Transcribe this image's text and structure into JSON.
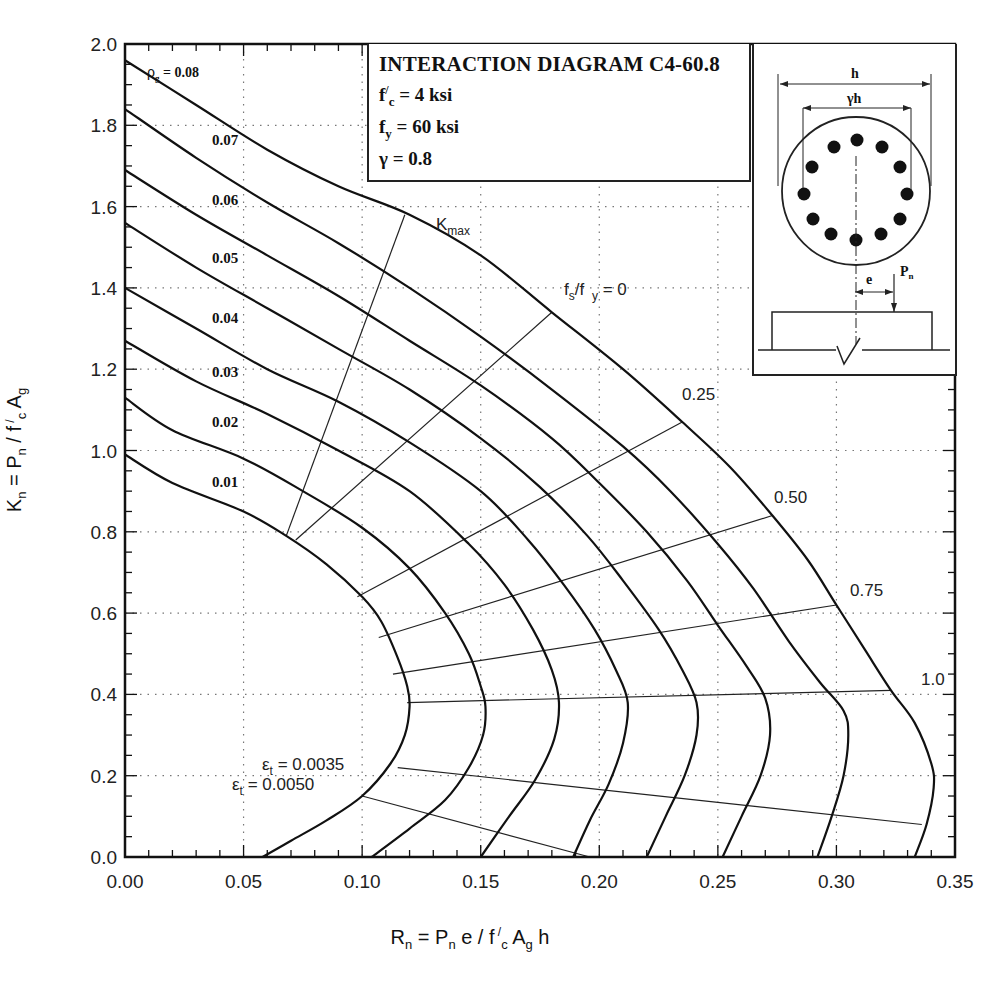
{
  "chart_data": {
    "type": "line",
    "title": "INTERACTION DIAGRAM C4-60.8",
    "parameters": [
      {
        "label": "f'c = 4 ksi"
      },
      {
        "label": "fy = 60 ksi"
      },
      {
        "label": "γ = 0.8"
      }
    ],
    "xlabel": "Rn = Pn e / f'c Ag h",
    "ylabel": "Kn = Pn / f'c Ag",
    "xlim": [
      0,
      0.35
    ],
    "ylim": [
      0,
      2.0
    ],
    "grid": "dotted",
    "x_ticks": [
      "0.00",
      "0.05",
      "0.10",
      "0.15",
      "0.20",
      "0.25",
      "0.30",
      "0.35"
    ],
    "y_ticks": [
      "0.0",
      "0.2",
      "0.4",
      "0.6",
      "0.8",
      "1.0",
      "1.2",
      "1.4",
      "1.6",
      "1.8",
      "2.0"
    ],
    "series": [
      {
        "name": "ρg = 0.01",
        "label": "0.01",
        "points": [
          [
            0,
            0.99
          ],
          [
            0.02,
            0.92
          ],
          [
            0.05,
            0.85
          ],
          [
            0.068,
            0.79
          ],
          [
            0.085,
            0.72
          ],
          [
            0.1,
            0.64
          ],
          [
            0.108,
            0.58
          ],
          [
            0.115,
            0.49
          ],
          [
            0.119,
            0.42
          ],
          [
            0.12,
            0.37
          ],
          [
            0.118,
            0.3
          ],
          [
            0.112,
            0.23
          ],
          [
            0.1,
            0.15
          ],
          [
            0.085,
            0.09
          ],
          [
            0.07,
            0.04
          ],
          [
            0.058,
            0
          ]
        ]
      },
      {
        "name": "ρg = 0.02",
        "label": "0.02",
        "points": [
          [
            0,
            1.13
          ],
          [
            0.02,
            1.05
          ],
          [
            0.05,
            0.98
          ],
          [
            0.075,
            0.9
          ],
          [
            0.1,
            0.81
          ],
          [
            0.12,
            0.71
          ],
          [
            0.135,
            0.6
          ],
          [
            0.145,
            0.5
          ],
          [
            0.15,
            0.42
          ],
          [
            0.152,
            0.37
          ],
          [
            0.151,
            0.3
          ],
          [
            0.145,
            0.22
          ],
          [
            0.135,
            0.14
          ],
          [
            0.12,
            0.07
          ],
          [
            0.104,
            0
          ]
        ]
      },
      {
        "name": "ρg = 0.03",
        "label": "0.03",
        "points": [
          [
            0,
            1.27
          ],
          [
            0.03,
            1.17
          ],
          [
            0.06,
            1.09
          ],
          [
            0.09,
            1.0
          ],
          [
            0.12,
            0.9
          ],
          [
            0.145,
            0.77
          ],
          [
            0.16,
            0.67
          ],
          [
            0.172,
            0.56
          ],
          [
            0.18,
            0.46
          ],
          [
            0.183,
            0.38
          ],
          [
            0.181,
            0.29
          ],
          [
            0.173,
            0.19
          ],
          [
            0.162,
            0.1
          ],
          [
            0.15,
            0
          ]
        ]
      },
      {
        "name": "ρg = 0.04",
        "label": "0.04",
        "points": [
          [
            0,
            1.4
          ],
          [
            0.03,
            1.3
          ],
          [
            0.06,
            1.2
          ],
          [
            0.09,
            1.12
          ],
          [
            0.12,
            1.02
          ],
          [
            0.15,
            0.9
          ],
          [
            0.17,
            0.78
          ],
          [
            0.185,
            0.67
          ],
          [
            0.198,
            0.56
          ],
          [
            0.207,
            0.46
          ],
          [
            0.212,
            0.38
          ],
          [
            0.21,
            0.28
          ],
          [
            0.204,
            0.18
          ],
          [
            0.196,
            0.09
          ],
          [
            0.189,
            0
          ]
        ]
      },
      {
        "name": "ρg = 0.05",
        "label": "0.05",
        "points": [
          [
            0,
            1.56
          ],
          [
            0.03,
            1.45
          ],
          [
            0.06,
            1.35
          ],
          [
            0.09,
            1.25
          ],
          [
            0.12,
            1.15
          ],
          [
            0.15,
            1.03
          ],
          [
            0.175,
            0.91
          ],
          [
            0.195,
            0.79
          ],
          [
            0.21,
            0.68
          ],
          [
            0.225,
            0.56
          ],
          [
            0.235,
            0.46
          ],
          [
            0.241,
            0.38
          ],
          [
            0.241,
            0.3
          ],
          [
            0.236,
            0.2
          ],
          [
            0.228,
            0.1
          ],
          [
            0.22,
            0
          ]
        ]
      },
      {
        "name": "ρg = 0.06",
        "label": "0.06",
        "points": [
          [
            0,
            1.69
          ],
          [
            0.03,
            1.58
          ],
          [
            0.06,
            1.48
          ],
          [
            0.09,
            1.38
          ],
          [
            0.12,
            1.27
          ],
          [
            0.15,
            1.16
          ],
          [
            0.18,
            1.03
          ],
          [
            0.2,
            0.92
          ],
          [
            0.22,
            0.8
          ],
          [
            0.237,
            0.68
          ],
          [
            0.25,
            0.57
          ],
          [
            0.262,
            0.47
          ],
          [
            0.27,
            0.39
          ],
          [
            0.272,
            0.3
          ],
          [
            0.268,
            0.2
          ],
          [
            0.26,
            0.1
          ],
          [
            0.252,
            0
          ]
        ]
      },
      {
        "name": "ρg = 0.07",
        "label": "0.07",
        "points": [
          [
            0,
            1.84
          ],
          [
            0.03,
            1.72
          ],
          [
            0.06,
            1.61
          ],
          [
            0.09,
            1.51
          ],
          [
            0.12,
            1.4
          ],
          [
            0.15,
            1.28
          ],
          [
            0.18,
            1.15
          ],
          [
            0.21,
            1.01
          ],
          [
            0.23,
            0.9
          ],
          [
            0.25,
            0.77
          ],
          [
            0.265,
            0.66
          ],
          [
            0.28,
            0.53
          ],
          [
            0.293,
            0.43
          ],
          [
            0.303,
            0.36
          ],
          [
            0.305,
            0.3
          ],
          [
            0.303,
            0.2
          ],
          [
            0.298,
            0.1
          ],
          [
            0.292,
            0
          ]
        ]
      },
      {
        "name": "ρg = 0.08",
        "label": "ρg = 0.08",
        "points": [
          [
            0,
            1.96
          ],
          [
            0.03,
            1.85
          ],
          [
            0.06,
            1.74
          ],
          [
            0.09,
            1.65
          ],
          [
            0.12,
            1.58
          ],
          [
            0.15,
            1.48
          ],
          [
            0.18,
            1.34
          ],
          [
            0.21,
            1.2
          ],
          [
            0.235,
            1.07
          ],
          [
            0.255,
            0.96
          ],
          [
            0.273,
            0.84
          ],
          [
            0.288,
            0.73
          ],
          [
            0.3,
            0.62
          ],
          [
            0.312,
            0.51
          ],
          [
            0.323,
            0.41
          ],
          [
            0.333,
            0.33
          ],
          [
            0.34,
            0.23
          ],
          [
            0.341,
            0.17
          ],
          [
            0.338,
            0.08
          ],
          [
            0.333,
            0
          ]
        ]
      }
    ],
    "guide_lines": [
      {
        "name": "Kmax",
        "label": "Kmax",
        "points": [
          [
            0.068,
            0.79
          ],
          [
            0.118,
            1.58
          ]
        ]
      },
      {
        "name": "fs/fy = 0",
        "label": "fs/fy = 0",
        "points": [
          [
            0.072,
            0.78
          ],
          [
            0.18,
            1.34
          ]
        ]
      },
      {
        "name": "fs/fy = 0.25",
        "label": "0.25",
        "points": [
          [
            0.098,
            0.64
          ],
          [
            0.235,
            1.07
          ]
        ]
      },
      {
        "name": "fs/fy = 0.50",
        "label": "0.50",
        "points": [
          [
            0.107,
            0.54
          ],
          [
            0.273,
            0.84
          ]
        ]
      },
      {
        "name": "fs/fy = 0.75",
        "label": "0.75",
        "points": [
          [
            0.113,
            0.45
          ],
          [
            0.3,
            0.62
          ]
        ]
      },
      {
        "name": "fs/fy = 1.0",
        "label": "1.0",
        "points": [
          [
            0.119,
            0.38
          ],
          [
            0.323,
            0.41
          ]
        ]
      },
      {
        "name": "εt = 0.0035",
        "label": "εt = 0.0035",
        "points": [
          [
            0.115,
            0.22
          ],
          [
            0.336,
            0.08
          ]
        ]
      },
      {
        "name": "εt = 0.0050",
        "label": "εt = 0.0050",
        "points": [
          [
            0.1,
            0.15
          ],
          [
            0.196,
            0.0
          ]
        ]
      }
    ]
  },
  "labels": {
    "title": "INTERACTION DIAGRAM C4-60.8",
    "fc_main": "f",
    "fc_prime": "/",
    "fc_sub": "c",
    "fc_rest": " = 4 ksi",
    "fy_main": "f",
    "fy_sub": "y",
    "fy_rest": " = 60 ksi",
    "gamma": "γ = 0.8",
    "ylabel_parts": {
      "a": "K",
      "a_sub": "n",
      "b": " = P",
      "b_sub": "n",
      "c": " / f",
      "c_sup": " /",
      "c_sub": "c",
      "d": " A",
      "d_sub": "g"
    },
    "xlabel_parts": {
      "a": "R",
      "a_sub": "n",
      "b": " = P",
      "b_sub": "n",
      "c": " e / f",
      "c_sup": " /",
      "c_sub": "c",
      "d": " A",
      "d_sub": "g",
      "e": " h"
    },
    "section": {
      "h": "h",
      "gh": "γh",
      "e": "e",
      "P": "P",
      "P_sub": "n"
    }
  }
}
